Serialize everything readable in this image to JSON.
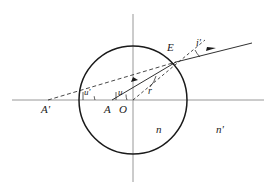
{
  "figure": {
    "type": "optical-refraction-diagram",
    "background_color": "#ffffff",
    "stroke_color": "#1a1a1a",
    "axis_color": "#808080",
    "labels": {
      "object_point": "A",
      "image_point": "A'",
      "vertex_origin": "O",
      "incidence_point": "E",
      "angle_u": "u",
      "angle_u_prime": "u'",
      "angle_r": "r",
      "angle_i_prime": "i'",
      "index_inside": "n",
      "index_outside": "n'"
    },
    "geometry": {
      "circle_center_x": 133,
      "circle_center_y": 100,
      "circle_radius": 54,
      "axis_y": 100,
      "vertical_axis_x": 133,
      "point_A_x": 112,
      "point_A_y": 100,
      "point_A_prime_x": 48,
      "point_A_prime_y": 100,
      "point_E_x": 176,
      "point_E_y": 62,
      "ray_end_x": 252,
      "ray_end_y": 43
    }
  }
}
